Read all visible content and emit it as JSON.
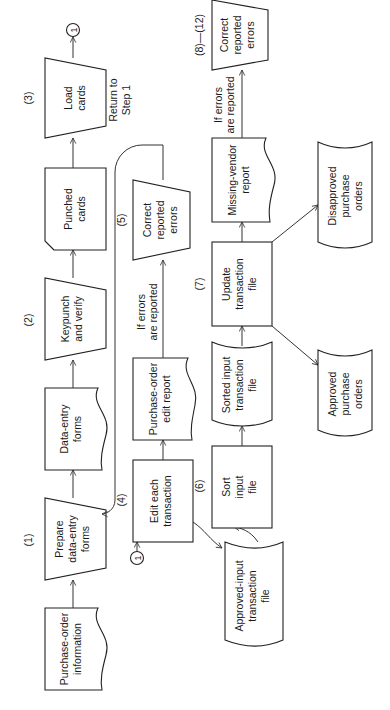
{
  "diagram": {
    "orientation": "rotated 90 degrees counter-clockwise",
    "row1": {
      "po_info": [
        "Purchase-order",
        "information"
      ],
      "step1_num": "(1)",
      "step1": [
        "Prepare",
        "data-entry",
        "forms"
      ],
      "data_entry_forms": [
        "Data-entry",
        "forms"
      ],
      "step2_num": "(2)",
      "step2": [
        "Keypunch",
        "and verify"
      ],
      "punched_cards": [
        "Punched",
        "cards"
      ],
      "step3_num": "(3)",
      "step3": [
        "Load",
        "cards"
      ],
      "connector_out": "1"
    },
    "row2": {
      "connector_in": "1",
      "step4_num": "(4)",
      "step4": [
        "Edit each",
        "transaction"
      ],
      "edit_report": [
        "Purchase-order",
        "edit report"
      ],
      "condition": [
        "If errors",
        "are reported"
      ],
      "step5_num": "(5)",
      "step5": [
        "Correct",
        "reported",
        "errors"
      ],
      "return_label": [
        "Return to",
        "Step 1"
      ],
      "approved_input_file": [
        "Approved-input",
        "transaction",
        "file"
      ]
    },
    "row3": {
      "step6_num": "(6)",
      "step6": [
        "Sort",
        "input",
        "file"
      ],
      "sorted_file": [
        "Sorted input",
        "transaction",
        "file"
      ],
      "step7_num": "(7)",
      "step7": [
        "Update",
        "transaction",
        "file"
      ],
      "missing_vendor": [
        "Missing-vendor",
        "report"
      ],
      "condition": [
        "If errors",
        "are reported"
      ],
      "step8_num": "(8)—(12)",
      "step8": [
        "Correct",
        "reported",
        "errors"
      ],
      "approved_po": [
        "Approved",
        "purchase",
        "orders"
      ],
      "disapproved_po": [
        "Disapproved",
        "purchase",
        "orders"
      ]
    }
  }
}
